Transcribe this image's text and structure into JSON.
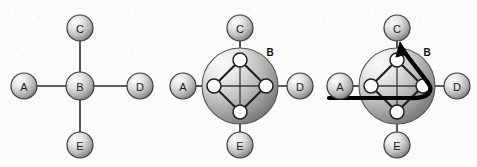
{
  "figure": {
    "background_color": "#fbfbfa",
    "edge_color": "#2b2b2b",
    "highlight_color": "#000000",
    "node_fill_light": "#f2f2f2",
    "node_fill_dark": "#6e6e6e",
    "inner_node_fill": "#ffffff"
  },
  "panels": [
    {
      "id": "panel-abstract",
      "caption": "",
      "outer_nodes": [
        {
          "label": "A",
          "cx": 24,
          "cy": 86,
          "r": 13
        },
        {
          "label": "C",
          "cx": 80,
          "cy": 28,
          "r": 13
        },
        {
          "label": "D",
          "cx": 140,
          "cy": 86,
          "r": 13
        },
        {
          "label": "E",
          "cx": 80,
          "cy": 145,
          "r": 13
        }
      ],
      "center_node": {
        "label": "B",
        "cx": 80,
        "cy": 86,
        "r": 14
      },
      "edges": [
        {
          "from": "A",
          "to": "B"
        },
        {
          "from": "C",
          "to": "B"
        },
        {
          "from": "D",
          "to": "B"
        },
        {
          "from": "E",
          "to": "B"
        }
      ]
    },
    {
      "id": "panel-expanded",
      "caption": "",
      "outer_nodes": [
        {
          "label": "A",
          "cx": 23,
          "cy": 86,
          "r": 13
        },
        {
          "label": "C",
          "cx": 80,
          "cy": 28,
          "r": 13
        },
        {
          "label": "D",
          "cx": 140,
          "cy": 86,
          "r": 13
        },
        {
          "label": "E",
          "cx": 80,
          "cy": 145,
          "r": 13
        }
      ],
      "super_node": {
        "label": "B",
        "cx": 80,
        "cy": 86,
        "r": 38,
        "label_x": 110,
        "label_y": 52
      },
      "inner_nodes": [
        {
          "name": "top",
          "cx": 80,
          "cy": 60,
          "r": 7
        },
        {
          "name": "left",
          "cx": 54,
          "cy": 86,
          "r": 7
        },
        {
          "name": "right",
          "cx": 106,
          "cy": 86,
          "r": 7
        },
        {
          "name": "bottom",
          "cx": 80,
          "cy": 112,
          "r": 7
        }
      ],
      "inner_edges": [
        {
          "from": "top",
          "to": "left"
        },
        {
          "from": "left",
          "to": "bottom"
        },
        {
          "from": "bottom",
          "to": "right"
        },
        {
          "from": "right",
          "to": "top"
        },
        {
          "from": "left",
          "to": "right"
        },
        {
          "from": "top",
          "to": "bottom"
        }
      ],
      "boundary_edges": [
        {
          "from": "A",
          "to": "left"
        },
        {
          "from": "C",
          "to": "top"
        },
        {
          "from": "D",
          "to": "right"
        },
        {
          "from": "E",
          "to": "bottom"
        }
      ]
    },
    {
      "id": "panel-path",
      "caption": "",
      "outer_nodes": [
        {
          "label": "A",
          "cx": 23,
          "cy": 86,
          "r": 13
        },
        {
          "label": "C",
          "cx": 80,
          "cy": 28,
          "r": 13
        },
        {
          "label": "D",
          "cx": 140,
          "cy": 86,
          "r": 13
        },
        {
          "label": "E",
          "cx": 80,
          "cy": 145,
          "r": 13
        }
      ],
      "super_node": {
        "label": "B",
        "cx": 80,
        "cy": 86,
        "r": 38,
        "label_x": 110,
        "label_y": 52
      },
      "inner_nodes": [
        {
          "name": "top",
          "cx": 80,
          "cy": 60,
          "r": 7
        },
        {
          "name": "left",
          "cx": 54,
          "cy": 86,
          "r": 7
        },
        {
          "name": "right",
          "cx": 106,
          "cy": 86,
          "r": 7
        },
        {
          "name": "bottom",
          "cx": 80,
          "cy": 112,
          "r": 7
        }
      ],
      "inner_edges": [
        {
          "from": "top",
          "to": "left"
        },
        {
          "from": "left",
          "to": "bottom"
        },
        {
          "from": "bottom",
          "to": "right"
        },
        {
          "from": "right",
          "to": "top"
        },
        {
          "from": "left",
          "to": "right"
        },
        {
          "from": "top",
          "to": "bottom"
        }
      ],
      "boundary_edges": [
        {
          "from": "A",
          "to": "left"
        },
        {
          "from": "C",
          "to": "top"
        },
        {
          "from": "D",
          "to": "right"
        },
        {
          "from": "E",
          "to": "bottom"
        }
      ],
      "highlight_path": {
        "description": "traced route entering from A side, sweeping right then curving up and out toward C with an arrowhead",
        "d": "M 12 98 L 92 98 C 112 98 118 92 112 84 C 106 74 98 66 86 50",
        "arrow_tip_x": 84,
        "arrow_tip_y": 45
      }
    }
  ],
  "panel_offsets_x": [
    0,
    160,
    317
  ]
}
